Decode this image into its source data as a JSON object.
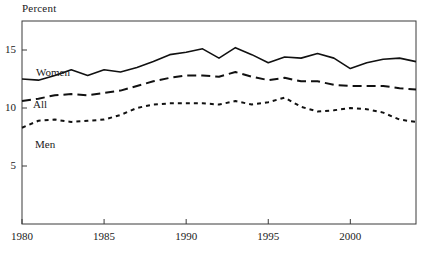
{
  "chart_data": {
    "type": "line",
    "title": "Percent",
    "xlabel": "",
    "ylabel": "Percent",
    "grid": false,
    "legend_position": "inline-labels",
    "xlim": [
      1980,
      2004
    ],
    "ylim": [
      0,
      17.5
    ],
    "x": [
      1980,
      1981,
      1982,
      1983,
      1984,
      1985,
      1986,
      1987,
      1988,
      1989,
      1990,
      1991,
      1992,
      1993,
      1994,
      1995,
      1996,
      1997,
      1998,
      1999,
      2000,
      2001,
      2002,
      2003,
      2004
    ],
    "xticks": [
      1980,
      1985,
      1990,
      1995,
      2000
    ],
    "xtick_labels": [
      "1980",
      "1985",
      "1990",
      "1995",
      "2000"
    ],
    "yticks": [
      5,
      10,
      15
    ],
    "ytick_labels": [
      "5",
      "10",
      "15"
    ],
    "series": [
      {
        "name": "Women",
        "style": "solid",
        "label": "Women",
        "values": [
          12.5,
          12.4,
          12.8,
          13.3,
          12.8,
          13.3,
          13.1,
          13.5,
          14.0,
          14.6,
          14.8,
          15.1,
          14.3,
          15.2,
          14.6,
          13.9,
          14.4,
          14.3,
          14.7,
          14.3,
          13.4,
          13.9,
          14.2,
          14.3,
          14.0
        ]
      },
      {
        "name": "All",
        "style": "dashed",
        "label": "All",
        "values": [
          10.6,
          10.8,
          11.1,
          11.2,
          11.1,
          11.3,
          11.5,
          11.9,
          12.3,
          12.6,
          12.8,
          12.8,
          12.7,
          13.1,
          12.7,
          12.4,
          12.6,
          12.3,
          12.3,
          12.0,
          11.9,
          11.9,
          11.9,
          11.7,
          11.6
        ]
      },
      {
        "name": "Men",
        "style": "dotted",
        "label": "Men",
        "values": [
          8.3,
          8.9,
          9.0,
          8.8,
          8.9,
          9.0,
          9.4,
          10.0,
          10.3,
          10.4,
          10.4,
          10.4,
          10.3,
          10.6,
          10.3,
          10.5,
          10.9,
          10.1,
          9.7,
          9.8,
          10.0,
          9.9,
          9.6,
          9.0,
          8.8
        ]
      }
    ]
  },
  "plot_geometry": {
    "left": 22,
    "right": 416,
    "top": 21,
    "bottom": 224
  },
  "labels": {
    "women": "Women",
    "all": "All",
    "men": "Men"
  }
}
